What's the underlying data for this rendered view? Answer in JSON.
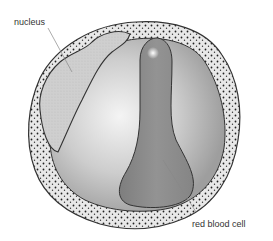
{
  "diagram": {
    "labels": {
      "nucleus": "nucleus",
      "red_blood_cell": "red blood cell"
    },
    "colors": {
      "background": "#ffffff",
      "cytoplasm_border": "#e6e6e6",
      "cytoplasm_inner_light": "#f2f2f2",
      "cytoplasm_inner_dark": "#a8a8a8",
      "nucleus_fill": "#cfcfcf",
      "red_blood_cell_fill": "#8c8c8c",
      "outline": "#333333",
      "granule": "#222222",
      "leader_line": "#888888"
    }
  }
}
